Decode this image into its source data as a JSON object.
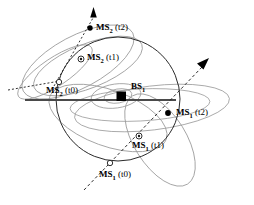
{
  "figure": {
    "type": "network-geometry-diagram",
    "background_color": "#ffffff",
    "width": 254,
    "height": 205
  },
  "colors": {
    "stroke_dark": "#1a1a1a",
    "stroke_gray": "#9a9a9a",
    "stroke_midgray": "#777777",
    "marker_fill": "#000000",
    "text": "#000000"
  },
  "labels": {
    "bs1": {
      "name": "BS",
      "sub": "1",
      "suffix": "",
      "x": 131,
      "y": 86
    },
    "ms2_t2": {
      "name": "MS",
      "sub": "2",
      "suffix": " (t2)",
      "x": 96,
      "y": 27
    },
    "ms2_t1": {
      "name": "MS",
      "sub": "2",
      "suffix": " (t1)",
      "x": 87,
      "y": 57
    },
    "ms2_t0": {
      "name": "MS",
      "sub": "2",
      "suffix": " (t0)",
      "x": 48,
      "y": 90
    },
    "ms1_t2": {
      "name": "MS",
      "sub": "1",
      "suffix": " (t2)",
      "x": 176,
      "y": 112
    },
    "ms1_t1": {
      "name": "MS",
      "sub": "1",
      "suffix": " (t1)",
      "x": 132,
      "y": 145
    },
    "ms1_t0": {
      "name": "MS",
      "sub": "1",
      "suffix": " (t0)",
      "x": 99,
      "y": 174
    }
  },
  "markers": {
    "bs1": {
      "shape": "filled-square",
      "x": 121,
      "y": 96,
      "size": 9
    },
    "ms2_t2": {
      "shape": "filled-dot",
      "x": 90,
      "y": 28,
      "r": 2.6
    },
    "ms2_t1": {
      "shape": "crosshair-circle",
      "x": 81,
      "y": 59,
      "r": 2.8
    },
    "ms2_t0": {
      "shape": "hollow-circle",
      "x": 59,
      "y": 82,
      "r": 2.6
    },
    "ms1_t2": {
      "shape": "filled-dot",
      "x": 168,
      "y": 113,
      "r": 2.8
    },
    "ms1_t1": {
      "shape": "crosshair-circle",
      "x": 139,
      "y": 136,
      "r": 2.8
    },
    "ms1_t0": {
      "shape": "hollow-circle",
      "x": 110,
      "y": 163,
      "r": 2.6
    }
  },
  "geometry": {
    "coverage_circle": {
      "cx": 118,
      "cy": 99,
      "r": 62
    },
    "horizontal_axis": {
      "x1": 25,
      "y1": 100,
      "x2": 176,
      "y2": 100
    },
    "trajectory_ms2": {
      "from_x": 52,
      "from_y": 88,
      "to_x": 95,
      "to_y": 12
    },
    "trajectory_ms1": {
      "from_x": 85,
      "from_y": 188,
      "to_x": 205,
      "to_y": 63
    }
  },
  "annotations": {
    "ms2_arrow_direction": "up",
    "ms1_arrow_direction": "up-right",
    "ellipse_count": 9
  }
}
